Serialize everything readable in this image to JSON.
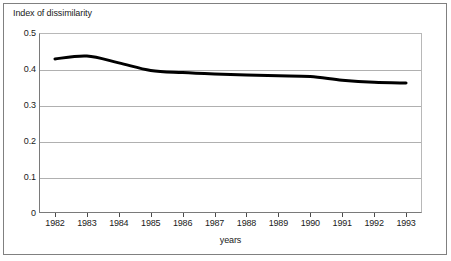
{
  "chart_data": {
    "type": "line",
    "title": "",
    "xlabel": "years",
    "ylabel": "Index of dissimilarity",
    "categories": [
      "1982",
      "1983",
      "1984",
      "1985",
      "1986",
      "1987",
      "1988",
      "1989",
      "1990",
      "1991",
      "1992",
      "1993"
    ],
    "series": [
      {
        "name": "Index of dissimilarity",
        "values": [
          0.428,
          0.436,
          0.417,
          0.396,
          0.39,
          0.386,
          0.383,
          0.381,
          0.379,
          0.369,
          0.363,
          0.361
        ],
        "color": "#000000"
      }
    ],
    "ylim": [
      0,
      0.5
    ],
    "yticks": [
      "0",
      "0.1",
      "0.2",
      "0.3",
      "0.4",
      "0.5"
    ],
    "ytick_values": [
      0,
      0.1,
      0.2,
      0.3,
      0.4,
      0.5
    ],
    "grid": true,
    "grid_axis": "y",
    "legend": "none",
    "legend_position": "none"
  },
  "axes": {
    "y_title": "Index of dissimilarity",
    "x_title": "years"
  },
  "colors": {
    "line": "#000000",
    "grid": "#b0b0b0",
    "frame": "#808080",
    "axis": "#7a7a7a",
    "text": "#1a1a1a",
    "background": "#ffffff"
  }
}
